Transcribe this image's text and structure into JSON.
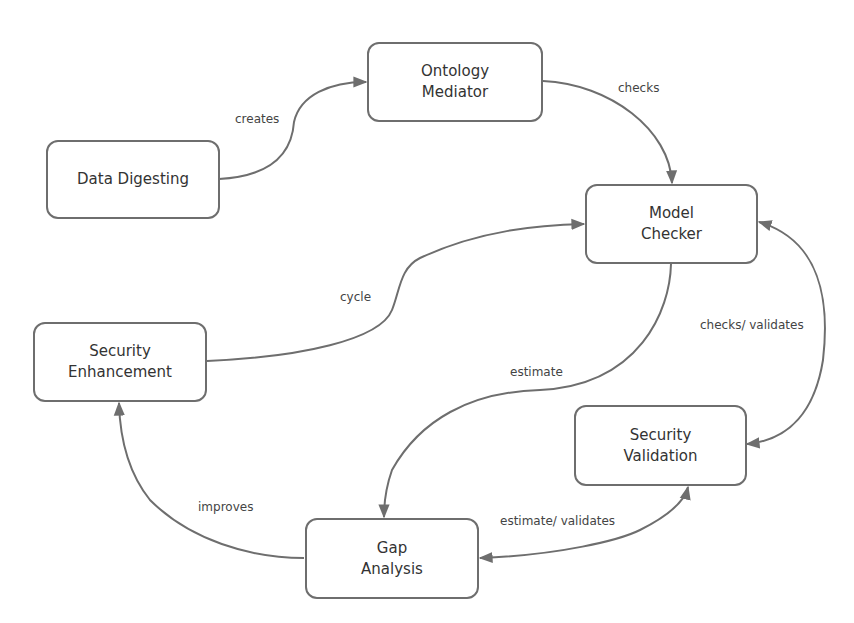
{
  "diagram": {
    "colors": {
      "stroke": "#6e6e6e",
      "text": "#333333",
      "background": "#ffffff"
    },
    "nodes": {
      "data_digesting": {
        "label": "Data Digesting"
      },
      "ontology_mediator": {
        "line1": "Ontology",
        "line2": "Mediator"
      },
      "model_checker": {
        "line1": "Model",
        "line2": "Checker"
      },
      "security_enhancement": {
        "line1": "Security",
        "line2": "Enhancement"
      },
      "security_validation": {
        "line1": "Security",
        "line2": "Validation"
      },
      "gap_analysis": {
        "line1": "Gap",
        "line2": "Analysis"
      }
    },
    "edges": [
      {
        "from": "Data Digesting",
        "to": "Ontology Mediator",
        "label": "creates"
      },
      {
        "from": "Ontology Mediator",
        "to": "Model Checker",
        "label": "checks"
      },
      {
        "from": "Security Enhancement",
        "to": "Model Checker",
        "label": "cycle"
      },
      {
        "from": "Model Checker",
        "to": "Security Validation",
        "label": "checks/ validates",
        "bidirectional": true
      },
      {
        "from": "Model Checker",
        "to": "Gap Analysis",
        "label": "estimate"
      },
      {
        "from": "Gap Analysis",
        "to": "Security Validation",
        "label": "estimate/ validates",
        "bidirectional": true
      },
      {
        "from": "Gap Analysis",
        "to": "Security Enhancement",
        "label": "improves"
      }
    ]
  }
}
